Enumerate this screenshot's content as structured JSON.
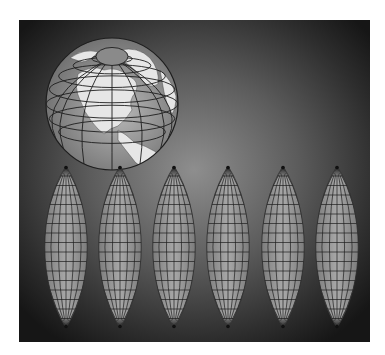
{
  "illustration": {
    "title": "",
    "description": "Orthographic globe above six interrupted globe gores",
    "colors": {
      "page_background": "#ffffff",
      "panel_center": "#8e8e8e",
      "panel_edge": "#161616",
      "ocean": "#9a9a9a",
      "land": "#e6e6e6",
      "graticule": "#1e1e1e"
    },
    "globe": {
      "cx": 112,
      "cy": 104,
      "r": 66,
      "meridians": 12,
      "parallels": 8
    },
    "gores": {
      "count": 6,
      "top_y": 166,
      "bottom_y": 328,
      "half_width": 27,
      "centers_x": [
        66,
        120,
        174,
        228,
        283,
        337
      ],
      "regions": [
        "North Pacific",
        "Americas",
        "Atlantic / Europe",
        "Africa / Europe",
        "Asia / Indian Ocean",
        "Australia / W. Pacific"
      ]
    }
  }
}
